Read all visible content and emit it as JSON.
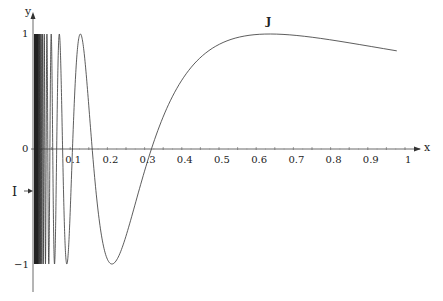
{
  "chart_data": {
    "type": "line",
    "title": "",
    "function": "y = sin(1/x)",
    "xlabel": "x",
    "ylabel": "y",
    "xlim": [
      0,
      1
    ],
    "ylim": [
      -1,
      1
    ],
    "grid": false,
    "x_ticks": [
      "0.1",
      "0.2",
      "0.3",
      "0.4",
      "0.5",
      "0.6",
      "0.7",
      "0.8",
      "0.9",
      "1"
    ],
    "y_ticks": [
      "1",
      "0",
      "-1"
    ],
    "annotations": [
      {
        "text": "J",
        "x": 0.637,
        "y": 1.0,
        "description": "label on curve near maximum"
      },
      {
        "text": "I",
        "x": 0,
        "y": -0.4,
        "description": "label with arrow pointing to y-axis segment"
      }
    ],
    "series": [
      {
        "name": "sin(1/x)",
        "x": [
          0.01,
          0.05,
          0.1,
          0.15,
          0.2,
          0.212,
          0.25,
          0.3,
          0.318,
          0.35,
          0.4,
          0.5,
          0.6,
          0.637,
          0.7,
          0.8,
          0.9,
          1.0
        ],
        "values": [
          -0.51,
          0.91,
          -0.54,
          0.37,
          -0.96,
          -1.0,
          -0.76,
          -0.19,
          0.0,
          0.28,
          0.6,
          0.91,
          0.995,
          1.0,
          0.99,
          0.95,
          0.9,
          0.84
        ]
      }
    ]
  },
  "labels": {
    "x_axis": "x",
    "y_axis": "y",
    "origin": "0",
    "y_one": "1",
    "y_minus_one": "−1",
    "J": "J",
    "I": "I"
  }
}
